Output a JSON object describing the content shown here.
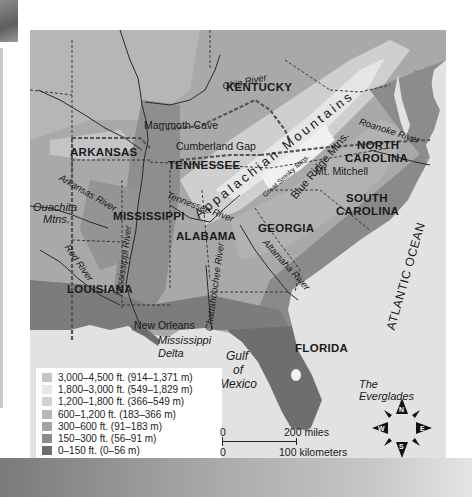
{
  "map": {
    "title": "Physical map of the Southeastern United States",
    "states": [
      {
        "name": "KENTUCKY",
        "x": 226,
        "y": 82
      },
      {
        "name": "ARKANSAS",
        "x": 42,
        "y": 148
      },
      {
        "name": "TENNESSEE",
        "x": 140,
        "y": 154
      },
      {
        "name": "NORTH",
        "x": 348,
        "y": 139
      },
      {
        "name": "CAROLINA",
        "x": 342,
        "y": 152
      },
      {
        "name": "SOUTH",
        "x": 345,
        "y": 193
      },
      {
        "name": "CAROLINA",
        "x": 340,
        "y": 206
      },
      {
        "name": "MISSISSIPPI",
        "x": 84,
        "y": 210
      },
      {
        "name": "ALABAMA",
        "x": 146,
        "y": 232
      },
      {
        "name": "GEORGIA",
        "x": 228,
        "y": 224
      },
      {
        "name": "LOUISIANA",
        "x": 38,
        "y": 284
      },
      {
        "name": "FLORIDA",
        "x": 266,
        "y": 341
      }
    ],
    "places": [
      {
        "name": "Mammoth Cave",
        "x": 146,
        "y": 96
      },
      {
        "name": "Cumberland Gap",
        "x": 178,
        "y": 116
      },
      {
        "name": "Mt. Mitchell",
        "x": 314,
        "y": 167
      },
      {
        "name": "New Orleans",
        "x": 104,
        "y": 294
      }
    ],
    "rivers": [
      {
        "name": "Ohio River",
        "x": 223,
        "y": 55,
        "rotate": -12
      },
      {
        "name": "Arkansas River",
        "x": 44,
        "y": 170,
        "rotate": 30
      },
      {
        "name": "Tennessee River",
        "x": 152,
        "y": 182,
        "rotate": 20
      },
      {
        "name": "Mississippi River",
        "x": 82,
        "y": 262,
        "rotate": -82
      },
      {
        "name": "Red River",
        "x": 36,
        "y": 242,
        "rotate": 55
      },
      {
        "name": "Chattahoochee River",
        "x": 175,
        "y": 284,
        "rotate": -82
      },
      {
        "name": "Altamaha River",
        "x": 248,
        "y": 262,
        "rotate": 48
      },
      {
        "name": "Roanoke River",
        "x": 356,
        "y": 118,
        "rotate": 18
      }
    ],
    "mountains": [
      {
        "name": "Appalachian Mountains",
        "x": 198,
        "y": 200,
        "rotate": -38
      },
      {
        "name": "Blue Ridge Mtns.",
        "x": 286,
        "y": 192,
        "rotate": -50
      },
      {
        "name": "Great Smoky Mtns.",
        "x": 257,
        "y": 179,
        "rotate": -42
      },
      {
        "name": "Ouachita",
        "x": 33,
        "y": 178
      },
      {
        "name": "Mtns.",
        "x": 43,
        "y": 190
      }
    ],
    "water_bodies": [
      {
        "name": "Mississippi",
        "x": 158,
        "y": 315
      },
      {
        "name": "Delta",
        "x": 158,
        "y": 328
      },
      {
        "name": "Gulf",
        "x": 224,
        "y": 348
      },
      {
        "name": "of",
        "x": 231,
        "y": 362
      },
      {
        "name": "Mexico",
        "x": 217,
        "y": 377
      },
      {
        "name": "The",
        "x": 359,
        "y": 377
      },
      {
        "name": "Everglades",
        "x": 359,
        "y": 389
      }
    ],
    "ocean_label": "ATLANTIC OCEAN"
  },
  "legend": {
    "items": [
      {
        "label": "3,000–4,500 ft. (914–1,371 m)",
        "color": "#c4c4c4"
      },
      {
        "label": "1,800–3,000 ft. (549–1,829 m)",
        "color": "#e6e6e6"
      },
      {
        "label": "1,200–1,800 ft. (366–549 m)",
        "color": "#d2d2d2"
      },
      {
        "label": "600–1,200 ft. (183–366 m)",
        "color": "#b8b8b8"
      },
      {
        "label": "300–600 ft. (91–183 m)",
        "color": "#a4a4a4"
      },
      {
        "label": "150–300 ft. (56–91 m)",
        "color": "#8c8c8c"
      },
      {
        "label": "0–150 ft. (0–56 m)",
        "color": "#6e6e6e"
      }
    ]
  },
  "scale": {
    "top_zero": "0",
    "top_label": "200 miles",
    "bottom_zero": "0",
    "bottom_label": "100 kilometers"
  },
  "compass": {
    "n": "N",
    "e": "E",
    "s": "S",
    "w": "W"
  },
  "colors": {
    "water": "#e2e2e2",
    "lowland": "#6e6e6e",
    "highland": "#e6e6e6"
  }
}
